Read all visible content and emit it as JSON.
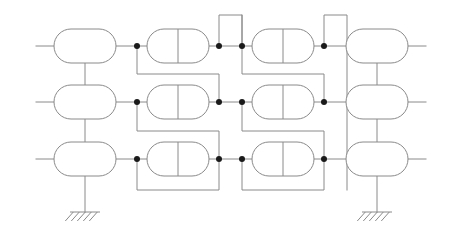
{
  "diagram": {
    "type": "electrical-block-schematic",
    "canvas": {
      "width": 452,
      "height": 246,
      "background": "#ffffff"
    },
    "style": {
      "wire_color": "#8a8a8a",
      "node_color": "#1a1a1a",
      "block_fill": "#ffffff",
      "stroke_width": 1
    },
    "rows": [
      {
        "name": "row-top",
        "y": 46
      },
      {
        "name": "row-middle",
        "y": 102
      },
      {
        "name": "row-bottom",
        "y": 159
      }
    ],
    "columns": [
      {
        "name": "column-1",
        "kind": "plain-capsule",
        "cx": 85,
        "divider": false
      },
      {
        "name": "column-2",
        "kind": "split-capsule",
        "cx": 178,
        "divider": true
      },
      {
        "name": "column-3",
        "kind": "split-capsule",
        "cx": 283,
        "divider": true
      },
      {
        "name": "column-4",
        "kind": "plain-capsule",
        "cx": 377,
        "divider": false
      }
    ],
    "capsule_size": {
      "width": 62,
      "height": 34,
      "radius": 17
    },
    "blocks": [
      {
        "name": "block-r1c1",
        "row": 0,
        "col": 0,
        "cx": 85,
        "cy": 46,
        "divider": false
      },
      {
        "name": "block-r1c2",
        "row": 0,
        "col": 1,
        "cx": 178,
        "cy": 46,
        "divider": true
      },
      {
        "name": "block-r1c3",
        "row": 0,
        "col": 2,
        "cx": 283,
        "cy": 46,
        "divider": true
      },
      {
        "name": "block-r1c4",
        "row": 0,
        "col": 3,
        "cx": 377,
        "cy": 46,
        "divider": false
      },
      {
        "name": "block-r2c1",
        "row": 1,
        "col": 0,
        "cx": 85,
        "cy": 102,
        "divider": false
      },
      {
        "name": "block-r2c2",
        "row": 1,
        "col": 1,
        "cx": 178,
        "cy": 102,
        "divider": true
      },
      {
        "name": "block-r2c3",
        "row": 1,
        "col": 2,
        "cx": 283,
        "cy": 102,
        "divider": true
      },
      {
        "name": "block-r2c4",
        "row": 1,
        "col": 3,
        "cx": 377,
        "cy": 102,
        "divider": false
      },
      {
        "name": "block-r3c1",
        "row": 2,
        "col": 0,
        "cx": 85,
        "cy": 159,
        "divider": false
      },
      {
        "name": "block-r3c2",
        "row": 2,
        "col": 1,
        "cx": 178,
        "cy": 159,
        "divider": true
      },
      {
        "name": "block-r3c3",
        "row": 2,
        "col": 2,
        "cx": 283,
        "cy": 159,
        "divider": true
      },
      {
        "name": "block-r3c4",
        "row": 2,
        "col": 3,
        "cx": 377,
        "cy": 159,
        "divider": false
      }
    ],
    "junction_dots": [
      {
        "name": "dot-r1-left-2",
        "x": 137,
        "y": 46,
        "r": 3
      },
      {
        "name": "dot-r1-right-2",
        "x": 219,
        "y": 46,
        "r": 3
      },
      {
        "name": "dot-r1-left-3",
        "x": 242,
        "y": 46,
        "r": 3
      },
      {
        "name": "dot-r1-right-3",
        "x": 324,
        "y": 46,
        "r": 3
      },
      {
        "name": "dot-r2-left-2",
        "x": 137,
        "y": 102,
        "r": 3
      },
      {
        "name": "dot-r2-right-2",
        "x": 219,
        "y": 102,
        "r": 3
      },
      {
        "name": "dot-r2-left-3",
        "x": 242,
        "y": 102,
        "r": 3
      },
      {
        "name": "dot-r2-right-3",
        "x": 324,
        "y": 102,
        "r": 3
      },
      {
        "name": "dot-r3-left-2",
        "x": 137,
        "y": 159,
        "r": 3
      },
      {
        "name": "dot-r3-right-2",
        "x": 219,
        "y": 159,
        "r": 3
      },
      {
        "name": "dot-r3-left-3",
        "x": 242,
        "y": 159,
        "r": 3
      },
      {
        "name": "dot-r3-right-3",
        "x": 324,
        "y": 159,
        "r": 3
      }
    ],
    "grounds": [
      {
        "name": "ground-left",
        "x": 85,
        "y": 212,
        "stem_from": 176,
        "width": 30,
        "hatches": 5
      },
      {
        "name": "ground-right",
        "x": 377,
        "y": 212,
        "stem_from": 176,
        "width": 30,
        "hatches": 5
      }
    ],
    "terminals": [
      {
        "name": "terminal-in-top",
        "x1": 36,
        "x2": 54,
        "y": 46
      },
      {
        "name": "terminal-in-middle",
        "x1": 36,
        "x2": 54,
        "y": 102
      },
      {
        "name": "terminal-in-bottom",
        "x1": 36,
        "x2": 54,
        "y": 159
      },
      {
        "name": "terminal-out-top",
        "x1": 408,
        "x2": 426,
        "y": 46
      },
      {
        "name": "terminal-out-middle",
        "x1": 408,
        "x2": 426,
        "y": 102
      },
      {
        "name": "terminal-out-bottom",
        "x1": 408,
        "x2": 426,
        "y": 159
      }
    ],
    "wire_paths": [
      {
        "name": "wire-r1-c1-to-dot",
        "d": "M 116 46 L 137 46"
      },
      {
        "name": "wire-r1-dot-to-c2",
        "d": "M 137 46 L 147 46"
      },
      {
        "name": "wire-r1-c2-to-dot",
        "d": "M 209 46 L 219 46"
      },
      {
        "name": "wire-r1-dot-to-dot",
        "d": "M 219 46 L 242 46"
      },
      {
        "name": "wire-r1-dot-to-c3",
        "d": "M 242 46 L 252 46"
      },
      {
        "name": "wire-r1-c3-to-dot",
        "d": "M 314 46 L 324 46"
      },
      {
        "name": "wire-r1-dot-to-c4",
        "d": "M 324 46 L 346 46"
      },
      {
        "name": "wire-r2-c1-to-dot",
        "d": "M 116 102 L 137 102"
      },
      {
        "name": "wire-r2-dot-to-c2",
        "d": "M 137 102 L 147 102"
      },
      {
        "name": "wire-r2-c2-to-dot",
        "d": "M 209 102 L 219 102"
      },
      {
        "name": "wire-r2-dot-to-dot",
        "d": "M 219 102 L 242 102"
      },
      {
        "name": "wire-r2-dot-to-c3",
        "d": "M 242 102 L 252 102"
      },
      {
        "name": "wire-r2-c3-to-dot",
        "d": "M 314 102 L 324 102"
      },
      {
        "name": "wire-r2-dot-to-c4",
        "d": "M 324 102 L 346 102"
      },
      {
        "name": "wire-r3-c1-to-dot",
        "d": "M 116 159 L 137 159"
      },
      {
        "name": "wire-r3-dot-to-c2",
        "d": "M 137 159 L 147 159"
      },
      {
        "name": "wire-r3-c2-to-dot",
        "d": "M 209 159 L 219 159"
      },
      {
        "name": "wire-r3-dot-to-dot",
        "d": "M 219 159 L 242 159"
      },
      {
        "name": "wire-r3-dot-to-c3",
        "d": "M 242 159 L 252 159"
      },
      {
        "name": "wire-r3-c3-to-dot",
        "d": "M 314 159 L 324 159"
      },
      {
        "name": "wire-r3-dot-to-c4",
        "d": "M 324 159 L 346 159"
      },
      {
        "name": "wire-col1-link-r1-r2",
        "d": "M 85 63 L 85 85"
      },
      {
        "name": "wire-col1-link-r2-r3",
        "d": "M 85 119 L 85 142"
      },
      {
        "name": "wire-col1-ground-stem",
        "d": "M 85 176 L 85 212"
      },
      {
        "name": "wire-col4-link-r1-r2",
        "d": "M 377 63 L 377 85"
      },
      {
        "name": "wire-col4-link-r2-r3",
        "d": "M 377 119 L 377 142"
      },
      {
        "name": "wire-col4-ground-stem",
        "d": "M 377 176 L 377 212"
      },
      {
        "name": "feedback-g2-row1-to-row2",
        "d": "M 137 46 L 137 74 L 219 74 L 219 102"
      },
      {
        "name": "feedback-g2-row2-to-row3",
        "d": "M 137 102 L 137 131 L 219 131 L 219 159"
      },
      {
        "name": "feedback-g2-row3-loop",
        "d": "M 137 159 L 137 190 L 219 190 L 219 159"
      },
      {
        "name": "feedback-g3-row1-to-row2",
        "d": "M 242 46 L 242 74 L 324 74 L 324 102"
      },
      {
        "name": "feedback-g3-row2-to-row3",
        "d": "M 242 102 L 242 131 L 324 131 L 324 159"
      },
      {
        "name": "feedback-g3-row3-loop",
        "d": "M 242 159 L 242 190 L 324 190 L 324 159"
      },
      {
        "name": "toploop-g2",
        "d": "M 219 46 L 219 15 L 242 15 L 242 46"
      },
      {
        "name": "toploop-g3",
        "d": "M 324 46 L 324 15 L 347 15 L 347 46"
      },
      {
        "name": "railline-g3-outer-down",
        "d": "M 347 46 L 347 190"
      },
      {
        "name": "railline-g2-outer-down",
        "d": "M 242 15 L 242 46"
      }
    ]
  }
}
